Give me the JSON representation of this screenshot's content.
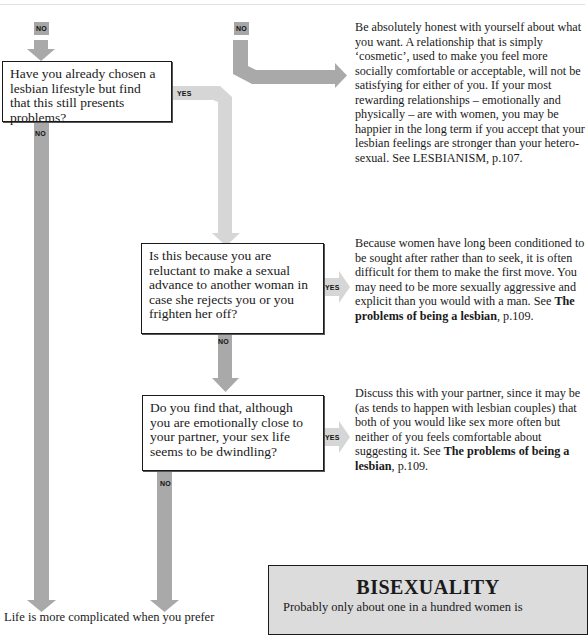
{
  "colors": {
    "arrow_dark": "#a9a9a9",
    "arrow_light": "#d6d6d6",
    "box_border": "#1a1a1a",
    "sidebar_bg": "#dcdcdc"
  },
  "labels": {
    "no_top_left": "NO",
    "no_top_mid": "NO",
    "q1_no": "NO",
    "q1_yes": "YES",
    "q2_no": "NO",
    "q2_yes": "YES",
    "q3_no": "NO",
    "q3_yes": "YES"
  },
  "questions": [
    {
      "id": "q1",
      "text": "Have you already chosen a lesbian lifestyle but find that this still presents problems?"
    },
    {
      "id": "q2",
      "text": "Is this because you are reluctant to make a sexual advance to another woman in case she rejects you or you frighten her off?"
    },
    {
      "id": "q3",
      "text": "Do you find that, although you are emotionally close to your partner, your sex life seems to be dwindling?"
    }
  ],
  "answers": [
    {
      "id": "a1",
      "text": "Be absolutely honest with yourself about what you want. A relationship that is simply ‘cosmetic’, used to make you feel more socially comfortable or acceptable, will not be satisfying for either of you. If your most rewarding relationships – emotionally and physically – are with women, you may be happier in the long term if you accept that your lesbian feelings are stronger than your hetero-sexual. See LESBIANISM, p.107."
    },
    {
      "id": "a2",
      "text_pre": "Because women have long been conditioned to be sought after rather than to seek, it is often difficult for them to make the first move. You may need to be more sexually aggressive and explicit than you would with a man. See ",
      "ref_bold": "The problems of being a lesbian",
      "ref_page": ", p.109."
    },
    {
      "id": "a3",
      "text_pre": "Discuss this with your partner, since it may be (as tends to happen with lesbian couples) that both of you would like sex more often but neither of you feels comfortable about suggesting it. See ",
      "ref_bold": "The problems of being a lesbian",
      "ref_page": ", p.109."
    }
  ],
  "bottom_text": "Life is more complicated when you prefer",
  "sidebar": {
    "title": "BISEXUALITY",
    "body_first_line": "Probably only about one in a hundred women is"
  }
}
